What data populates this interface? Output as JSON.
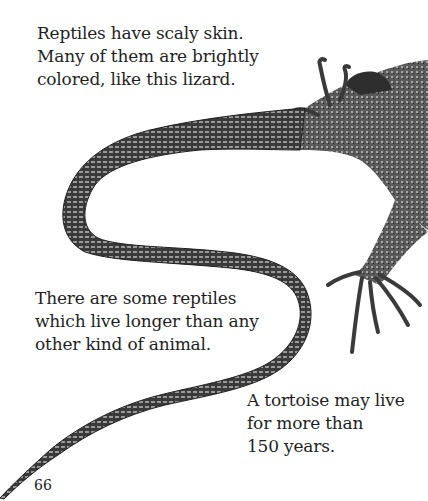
{
  "page": {
    "paragraphs": {
      "top": {
        "lines": [
          "Reptiles have scaly skin.",
          "Many of them are brightly",
          "colored, like this lizard."
        ]
      },
      "middle": {
        "lines": [
          "There are some reptiles",
          "which live longer than any",
          "other kind of animal."
        ]
      },
      "bottom": {
        "lines": [
          "A tortoise may live",
          "for more than",
          "150 years."
        ]
      }
    },
    "page_number": "66",
    "illustration": {
      "subject": "lizard",
      "colors": {
        "ink": "#1e1e1e",
        "mid": "#6a6a6a",
        "light": "#bdbdbd",
        "paper": "#ffffff"
      }
    }
  }
}
